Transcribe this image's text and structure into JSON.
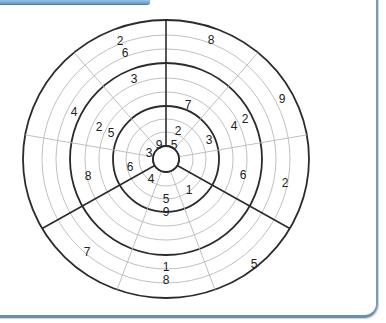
{
  "puzzle": {
    "type": "circular-sudoku",
    "center": {
      "x": 166,
      "y": 159
    },
    "ring_radii": [
      13,
      27,
      40,
      53,
      67,
      81,
      96,
      110,
      124,
      139
    ],
    "heavy_ring_indices": [
      0,
      3,
      6,
      9
    ],
    "sector_angles_deg": [
      90,
      130,
      170,
      210,
      250,
      290,
      330,
      10,
      50
    ],
    "heavy_sector_angles_deg": [
      90,
      210,
      330
    ],
    "colors": {
      "heavy_line": "#2b2b2b",
      "thin_line": "#b9b9b9",
      "digit": "#222222",
      "frame_border": "#7a9bb8",
      "tab_bar": "#5f97c8"
    },
    "givens": [
      {
        "value": "2",
        "x": 120,
        "y": 41
      },
      {
        "value": "6",
        "x": 125,
        "y": 53
      },
      {
        "value": "8",
        "x": 211,
        "y": 40
      },
      {
        "value": "3",
        "x": 134,
        "y": 79
      },
      {
        "value": "9",
        "x": 282,
        "y": 99
      },
      {
        "value": "4",
        "x": 74,
        "y": 112
      },
      {
        "value": "7",
        "x": 188,
        "y": 105
      },
      {
        "value": "2",
        "x": 99,
        "y": 127
      },
      {
        "value": "5",
        "x": 111,
        "y": 133
      },
      {
        "value": "2",
        "x": 245,
        "y": 119
      },
      {
        "value": "4",
        "x": 234,
        "y": 126
      },
      {
        "value": "2",
        "x": 178,
        "y": 131
      },
      {
        "value": "3",
        "x": 209,
        "y": 140
      },
      {
        "value": "9",
        "x": 159,
        "y": 145
      },
      {
        "value": "5",
        "x": 174,
        "y": 145
      },
      {
        "value": "3",
        "x": 149,
        "y": 153
      },
      {
        "value": "6",
        "x": 130,
        "y": 167
      },
      {
        "value": "8",
        "x": 88,
        "y": 176
      },
      {
        "value": "6",
        "x": 243,
        "y": 175
      },
      {
        "value": "2",
        "x": 285,
        "y": 183
      },
      {
        "value": "4",
        "x": 151,
        "y": 179
      },
      {
        "value": "1",
        "x": 189,
        "y": 190
      },
      {
        "value": "5",
        "x": 166,
        "y": 199
      },
      {
        "value": "9",
        "x": 166,
        "y": 212
      },
      {
        "value": "7",
        "x": 87,
        "y": 252
      },
      {
        "value": "1",
        "x": 166,
        "y": 267
      },
      {
        "value": "8",
        "x": 166,
        "y": 280
      },
      {
        "value": "5",
        "x": 254,
        "y": 264
      }
    ]
  }
}
